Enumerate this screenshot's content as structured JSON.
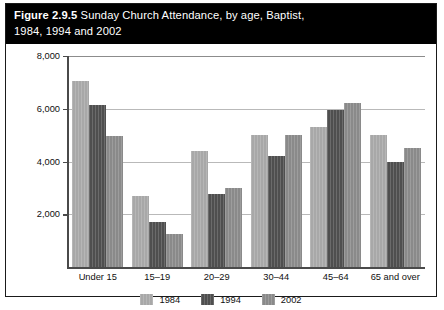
{
  "figure": {
    "number_label": "Figure 2.9.5",
    "title_rest": " Sunday Church Attendance, by age, Baptist,",
    "title_line2": "1984, 1994 and 2002"
  },
  "colors": {
    "band_background": "#000000",
    "band_text": "#ffffff",
    "series_1984": "#a8a8a8",
    "series_1994": "#4f4f4f",
    "series_2002": "#8a8a8a",
    "gridline": "#b9b9b9",
    "axis": "#4a4a4a",
    "border": "#1a1a1a"
  },
  "chart_data": {
    "type": "bar",
    "xlabel": "",
    "ylabel": "",
    "categories": [
      "Under 15",
      "15–19",
      "20–29",
      "30–44",
      "45–64",
      "65 and over"
    ],
    "series": [
      {
        "name": "1984",
        "values": [
          7050,
          2700,
          4400,
          5000,
          5300,
          5000
        ]
      },
      {
        "name": "1994",
        "values": [
          6150,
          1700,
          2750,
          4200,
          5950,
          4000
        ]
      },
      {
        "name": "2002",
        "values": [
          4950,
          1250,
          3000,
          5000,
          6200,
          4500
        ]
      }
    ],
    "ylim": [
      0,
      8000
    ],
    "yticks": [
      2000,
      4000,
      6000,
      8000
    ],
    "ytick_labels": [
      "2,000",
      "4,000",
      "6,000",
      "8,000"
    ],
    "grid": true,
    "legend_position": "bottom"
  }
}
